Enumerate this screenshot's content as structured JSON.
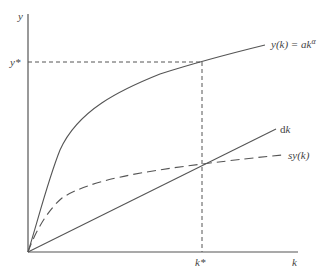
{
  "diagram": {
    "axes": {
      "y_label": "y",
      "x_label": "k"
    },
    "markers": {
      "y_star": "y*",
      "k_star": "k*"
    },
    "curves": [
      {
        "id": "production",
        "label": "y(k) = ak",
        "label_exp": "α",
        "style": "solid"
      },
      {
        "id": "depreciation",
        "label_prefix": "d",
        "label_var": "k",
        "style": "solid"
      },
      {
        "id": "savings",
        "label": "sy(k)",
        "style": "dashed"
      }
    ],
    "colors": {
      "line": "#555555",
      "text": "#444444",
      "background": "#ffffff"
    }
  }
}
